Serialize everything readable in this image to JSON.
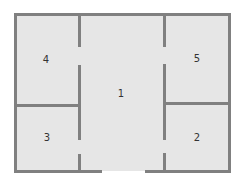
{
  "diagram": {
    "type": "floor-plan",
    "colors": {
      "floor": "#e6e6e6",
      "wall": "#808080",
      "background": "#ffffff",
      "label": "#333333"
    },
    "rooms": [
      {
        "id": "1",
        "label": "1",
        "name": "central-hall"
      },
      {
        "id": "2",
        "label": "2",
        "name": "bottom-right-room"
      },
      {
        "id": "3",
        "label": "3",
        "name": "bottom-left-room"
      },
      {
        "id": "4",
        "label": "4",
        "name": "top-left-room"
      },
      {
        "id": "5",
        "label": "5",
        "name": "top-right-room"
      }
    ]
  }
}
